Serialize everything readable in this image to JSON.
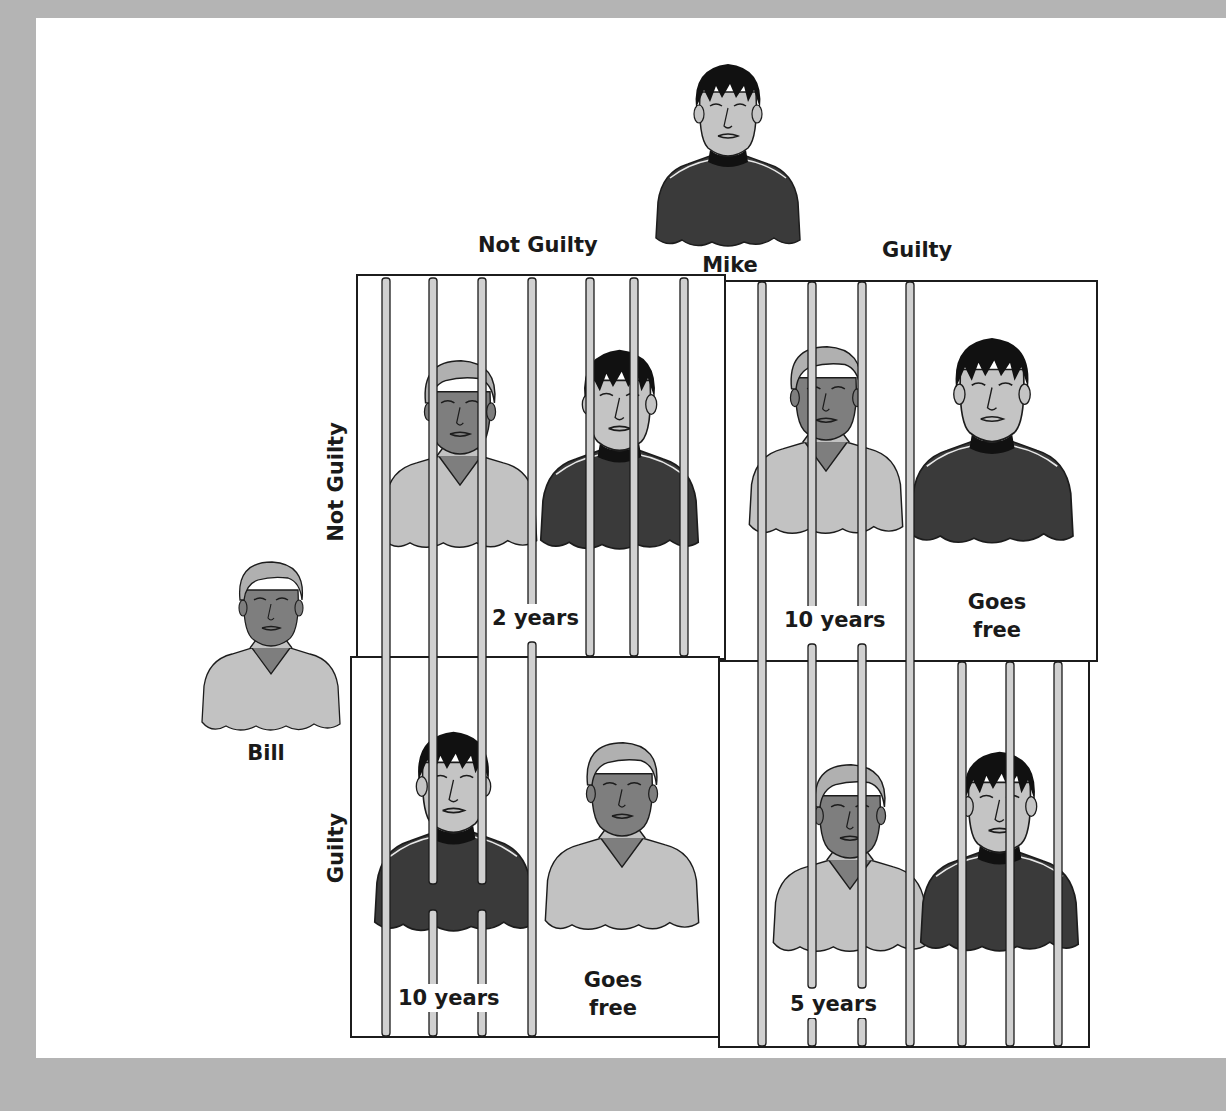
{
  "players": {
    "column_player": "Mike",
    "row_player": "Bill"
  },
  "column_headers": [
    "Not Guilty",
    "Guilty"
  ],
  "row_headers": [
    "Not Guilty",
    "Guilty"
  ],
  "cells": [
    {
      "bill": "Not Guilty",
      "mike": "Not Guilty",
      "outcomes": [
        "2 years"
      ],
      "both_jailed": true
    },
    {
      "bill": "Not Guilty",
      "mike": "Guilty",
      "outcomes": [
        "10 years",
        "Goes free"
      ],
      "jailed": "Bill"
    },
    {
      "bill": "Guilty",
      "mike": "Not Guilty",
      "outcomes": [
        "10 years",
        "Goes free"
      ],
      "jailed": "Mike"
    },
    {
      "bill": "Guilty",
      "mike": "Guilty",
      "outcomes": [
        "5 years"
      ],
      "both_jailed": true
    }
  ],
  "colors": {
    "background_frame": "#b4b4b4",
    "page": "#ffffff",
    "mike_shirt": "#3a3a3a",
    "mike_hair": "#111111",
    "mike_skin": "#c4c4c4",
    "bill_shirt": "#c2c2c2",
    "bill_hair": "#b0b0b0",
    "bill_skin": "#7e7e7e",
    "bar_fill": "#d0d0d0",
    "line": "#1c1c1c"
  }
}
